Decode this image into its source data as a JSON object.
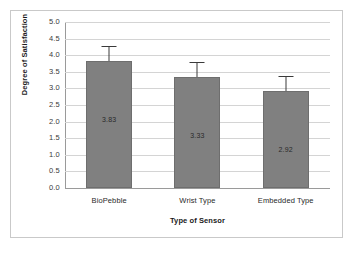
{
  "chart_data": {
    "type": "bar",
    "title": "",
    "xlabel": "Type of Sensor",
    "ylabel": "Degree of Satisfaction",
    "categories": [
      "BioPebble",
      "Wrist Type",
      "Embedded Type"
    ],
    "values": [
      3.83,
      3.33,
      2.92
    ],
    "value_labels": [
      "3.83",
      "3.33",
      "2.92"
    ],
    "errors": [
      0.42,
      0.45,
      0.42
    ],
    "ylim": [
      0.0,
      5.0
    ],
    "ytick_labels": [
      "5.0",
      "4.5",
      "4.0",
      "3.5",
      "3.0",
      "2.5",
      "2.0",
      "1.5",
      "1.0",
      "0.5",
      "0.0"
    ],
    "ytick_values": [
      5.0,
      4.5,
      4.0,
      3.5,
      3.0,
      2.5,
      2.0,
      1.5,
      1.0,
      0.5,
      0.0
    ],
    "grid": "horizontal",
    "legend": "none",
    "bar_color": "#808080",
    "error_color": "#3a3a3a",
    "grid_color": "#d4d4d4",
    "axis_color": "#9a9a9a",
    "frame_color": "#c9c9c9",
    "background": "#ffffff"
  }
}
